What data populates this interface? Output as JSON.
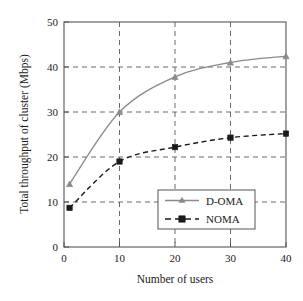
{
  "chart_data": {
    "type": "line",
    "title": "",
    "xlabel": "Number of users",
    "ylabel": "Total throughput of cluster (Mbps)",
    "xlim": [
      0,
      40
    ],
    "ylim": [
      0,
      50
    ],
    "xticks": [
      0,
      10,
      20,
      30,
      40
    ],
    "yticks": [
      0,
      10,
      20,
      30,
      40,
      50
    ],
    "xtick_labels": [
      "0",
      "10",
      "20",
      "30",
      "40"
    ],
    "ytick_labels": [
      "0",
      "10",
      "20",
      "30",
      "40",
      "50"
    ],
    "grid": true,
    "grid_style": "dashed",
    "legend_position": "lower-right-inside",
    "series": [
      {
        "name": "D-OMA",
        "color": "#8a8a8a",
        "line_style": "solid",
        "marker": "triangle",
        "x": [
          1,
          10,
          20,
          30,
          40
        ],
        "values": [
          14.0,
          30.0,
          37.8,
          41.0,
          42.4
        ]
      },
      {
        "name": "NOMA",
        "color": "#1a1a1a",
        "line_style": "dashed",
        "marker": "square",
        "x": [
          1,
          10,
          20,
          30,
          40
        ],
        "values": [
          8.7,
          19.0,
          22.2,
          24.3,
          25.2
        ]
      }
    ]
  },
  "axes": {
    "x_title": "Number of users",
    "y_title": "Total throughput of cluster (Mbps)"
  },
  "ticks": {
    "x": [
      "0",
      "10",
      "20",
      "30",
      "40"
    ],
    "y": [
      "0",
      "10",
      "20",
      "30",
      "40",
      "50"
    ]
  },
  "legend": {
    "entries": [
      {
        "label": "D-OMA"
      },
      {
        "label": "NOMA"
      }
    ]
  },
  "colors": {
    "d_oma": "#8a8a8a",
    "noma": "#1a1a1a",
    "grid": "#666666",
    "frame": "#555555",
    "background": "#ffffff"
  }
}
